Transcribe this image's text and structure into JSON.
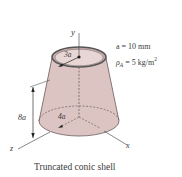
{
  "figure": {
    "caption": "Truncated conic shell",
    "axes": {
      "y": "y",
      "x": "x",
      "z": "z"
    },
    "dimensions": {
      "top_radius": "3a",
      "bottom_radius": "4a",
      "height": "8a"
    },
    "given": {
      "a_label": "a = 10 mm",
      "rho_symbol": "ρ",
      "rho_sub": "A",
      "rho_value": " = 5 kg/m",
      "rho_exp": "2"
    },
    "colors": {
      "shell_fill": "#dcc4c3",
      "shell_inner": "#c8a9a8",
      "line": "#555555"
    }
  }
}
